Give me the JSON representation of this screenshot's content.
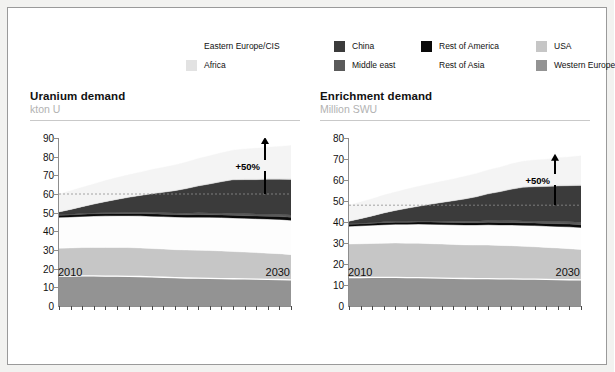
{
  "legend": {
    "items": [
      {
        "label": "Eastern Europe/CIS",
        "color": "#f4f4f4",
        "key": "eastern-europe-cis",
        "row": 0,
        "col": 0
      },
      {
        "label": "China",
        "color": "#3b3b3b",
        "key": "china",
        "row": 0,
        "col": 1
      },
      {
        "label": "Rest of America",
        "color": "#0a0a0a",
        "key": "rest-of-america",
        "row": 0,
        "col": 2
      },
      {
        "label": "USA",
        "color": "#c6c6c6",
        "key": "usa",
        "row": 0,
        "col": 3
      },
      {
        "label": "Africa",
        "color": "#e2e2e2",
        "key": "africa",
        "row": 1,
        "col": 0
      },
      {
        "label": "Middle east",
        "color": "#5a5a5a",
        "key": "middle-east",
        "row": 1,
        "col": 1
      },
      {
        "label": "Rest of Asia",
        "color": "#fdfdfd",
        "key": "rest-of-asia",
        "row": 1,
        "col": 2
      },
      {
        "label": "Western Europe",
        "color": "#939393",
        "key": "western-europe",
        "row": 1,
        "col": 3
      }
    ]
  },
  "chart_data": [
    {
      "type": "area",
      "id": "uranium-demand",
      "title": "Uranium demand",
      "subtitle": "kton U",
      "ylabel": "kton U",
      "xlabel": "",
      "ylim": [
        0,
        90
      ],
      "yticks": [
        0,
        10,
        20,
        30,
        40,
        50,
        60,
        70,
        80,
        90
      ],
      "xlim": [
        2010,
        2030
      ],
      "xticklabels": [
        "2010",
        "2030"
      ],
      "x": [
        2010,
        2011,
        2012,
        2013,
        2014,
        2015,
        2016,
        2017,
        2018,
        2019,
        2020,
        2021,
        2022,
        2023,
        2024,
        2025,
        2026,
        2027,
        2028,
        2029,
        2030
      ],
      "stack_order": [
        "Western Europe",
        "USA",
        "Rest of Asia",
        "Rest of America",
        "Middle east",
        "China",
        "Africa",
        "Eastern Europe/CIS"
      ],
      "series": [
        {
          "name": "Western Europe",
          "color": "#939393",
          "values": [
            16.0,
            16.0,
            16.1,
            16.1,
            16.0,
            16.0,
            15.9,
            15.8,
            15.6,
            15.4,
            15.2,
            15.0,
            14.9,
            14.8,
            14.7,
            14.6,
            14.5,
            14.4,
            14.3,
            14.2,
            14.0
          ]
        },
        {
          "name": "USA",
          "color": "#c6c6c6",
          "values": [
            15.0,
            15.1,
            15.2,
            15.3,
            15.4,
            15.4,
            15.4,
            15.3,
            15.2,
            15.1,
            15.0,
            15.0,
            15.0,
            14.9,
            14.8,
            14.6,
            14.4,
            14.2,
            14.0,
            13.8,
            13.5
          ]
        },
        {
          "name": "Rest of Asia",
          "color": "#fdfdfd",
          "values": [
            16.5,
            16.6,
            16.7,
            16.8,
            16.9,
            17.0,
            17.1,
            17.2,
            17.3,
            17.4,
            17.5,
            17.6,
            17.7,
            17.8,
            17.9,
            18.0,
            18.1,
            18.2,
            18.3,
            18.4,
            18.5
          ]
        },
        {
          "name": "Rest of America",
          "color": "#0a0a0a",
          "values": [
            1.1,
            1.1,
            1.1,
            1.2,
            1.2,
            1.2,
            1.2,
            1.3,
            1.3,
            1.3,
            1.3,
            1.3,
            1.4,
            1.4,
            1.4,
            1.4,
            1.4,
            1.4,
            1.5,
            1.5,
            1.5
          ]
        },
        {
          "name": "Middle east",
          "color": "#5a5a5a",
          "values": [
            0.3,
            0.3,
            0.4,
            0.4,
            0.5,
            0.5,
            0.6,
            0.6,
            0.7,
            0.7,
            0.8,
            0.8,
            0.9,
            0.9,
            1.0,
            1.0,
            1.1,
            1.1,
            1.2,
            1.2,
            1.3
          ]
        },
        {
          "name": "China",
          "color": "#3b3b3b",
          "values": [
            1.5,
            2.6,
            3.7,
            4.8,
            5.9,
            7.0,
            8.0,
            9.0,
            10.0,
            11.0,
            12.0,
            13.2,
            14.4,
            15.6,
            16.8,
            18.0,
            18.2,
            18.4,
            18.6,
            18.8,
            19.0
          ]
        },
        {
          "name": "Africa",
          "color": "#e2e2e2",
          "values": [
            0.2,
            0.2,
            0.2,
            0.2,
            0.3,
            0.3,
            0.3,
            0.3,
            0.4,
            0.4,
            0.4,
            0.4,
            0.5,
            0.5,
            0.5,
            0.5,
            0.6,
            0.6,
            0.6,
            0.6,
            0.7
          ]
        },
        {
          "name": "Eastern Europe/CIS",
          "color": "#f4f4f4",
          "values": [
            9.4,
            9.8,
            10.2,
            10.6,
            11.0,
            11.4,
            11.8,
            12.2,
            12.6,
            13.0,
            13.4,
            13.8,
            14.2,
            14.6,
            15.0,
            15.4,
            15.8,
            16.2,
            16.6,
            17.0,
            17.5
          ]
        }
      ],
      "total": [
        60.0,
        61.7,
        63.6,
        65.4,
        67.2,
        68.8,
        70.3,
        71.7,
        73.1,
        74.3,
        75.6,
        77.1,
        78.9,
        80.5,
        82.1,
        83.5,
        84.1,
        84.5,
        85.1,
        85.5,
        86.0
      ],
      "annotation": {
        "text": "+50%",
        "from": 60,
        "to": 90
      }
    },
    {
      "type": "area",
      "id": "enrichment-demand",
      "title": "Enrichment demand",
      "subtitle": "Million SWU",
      "ylabel": "Million SWU",
      "xlabel": "",
      "ylim": [
        0,
        80
      ],
      "yticks": [
        0,
        10,
        20,
        30,
        40,
        50,
        60,
        70,
        80
      ],
      "xlim": [
        2010,
        2030
      ],
      "xticklabels": [
        "2010",
        "2030"
      ],
      "x": [
        2010,
        2011,
        2012,
        2013,
        2014,
        2015,
        2016,
        2017,
        2018,
        2019,
        2020,
        2021,
        2022,
        2023,
        2024,
        2025,
        2026,
        2027,
        2028,
        2029,
        2030
      ],
      "stack_order": [
        "Western Europe",
        "USA",
        "Rest of Asia",
        "Rest of America",
        "Middle east",
        "China",
        "Africa",
        "Eastern Europe/CIS"
      ],
      "series": [
        {
          "name": "Western Europe",
          "color": "#939393",
          "values": [
            13.5,
            13.5,
            13.6,
            13.6,
            13.6,
            13.5,
            13.5,
            13.4,
            13.3,
            13.2,
            13.1,
            13.0,
            13.0,
            12.9,
            12.9,
            12.8,
            12.8,
            12.7,
            12.6,
            12.5,
            12.4
          ]
        },
        {
          "name": "USA",
          "color": "#c6c6c6",
          "values": [
            16.0,
            16.1,
            16.2,
            16.3,
            16.4,
            16.4,
            16.4,
            16.3,
            16.2,
            16.1,
            16.0,
            16.0,
            16.0,
            15.9,
            15.8,
            15.6,
            15.4,
            15.2,
            15.0,
            14.8,
            14.5
          ]
        },
        {
          "name": "Rest of Asia",
          "color": "#fdfdfd",
          "values": [
            8.5,
            8.6,
            8.7,
            8.8,
            8.9,
            9.0,
            9.1,
            9.2,
            9.3,
            9.4,
            9.5,
            9.6,
            9.7,
            9.8,
            9.9,
            10.0,
            10.1,
            10.2,
            10.3,
            10.4,
            10.5
          ]
        },
        {
          "name": "Rest of America",
          "color": "#0a0a0a",
          "values": [
            0.9,
            0.9,
            0.9,
            1.0,
            1.0,
            1.0,
            1.0,
            1.1,
            1.1,
            1.1,
            1.1,
            1.1,
            1.2,
            1.2,
            1.2,
            1.2,
            1.2,
            1.2,
            1.3,
            1.3,
            1.3
          ]
        },
        {
          "name": "Middle east",
          "color": "#5a5a5a",
          "values": [
            0.3,
            0.3,
            0.3,
            0.4,
            0.4,
            0.4,
            0.5,
            0.5,
            0.6,
            0.6,
            0.7,
            0.7,
            0.8,
            0.8,
            0.9,
            0.9,
            1.0,
            1.0,
            1.1,
            1.1,
            1.2
          ]
        },
        {
          "name": "China",
          "color": "#3b3b3b",
          "values": [
            1.2,
            2.2,
            3.2,
            4.2,
            5.2,
            6.2,
            7.0,
            7.9,
            8.8,
            9.7,
            10.6,
            11.6,
            12.7,
            13.8,
            14.9,
            16.0,
            16.3,
            16.6,
            16.9,
            17.2,
            17.5
          ]
        },
        {
          "name": "Africa",
          "color": "#e2e2e2",
          "values": [
            0.2,
            0.2,
            0.2,
            0.2,
            0.2,
            0.3,
            0.3,
            0.3,
            0.3,
            0.3,
            0.4,
            0.4,
            0.4,
            0.4,
            0.5,
            0.5,
            0.5,
            0.5,
            0.6,
            0.6,
            0.6
          ]
        },
        {
          "name": "Eastern Europe/CIS",
          "color": "#f4f4f4",
          "values": [
            7.4,
            7.7,
            8.0,
            8.3,
            8.6,
            8.9,
            9.2,
            9.5,
            9.8,
            10.1,
            10.4,
            10.7,
            11.0,
            11.3,
            11.6,
            11.9,
            12.2,
            12.5,
            12.8,
            13.1,
            13.5
          ]
        }
      ],
      "total": [
        48.0,
        49.5,
        51.1,
        52.8,
        54.3,
        55.7,
        57.0,
        58.2,
        59.4,
        60.5,
        61.8,
        63.1,
        64.8,
        66.1,
        67.7,
        68.9,
        69.5,
        69.9,
        70.6,
        71.0,
        71.5
      ],
      "annotation": {
        "text": "+50%",
        "from": 48,
        "to": 72
      }
    }
  ]
}
